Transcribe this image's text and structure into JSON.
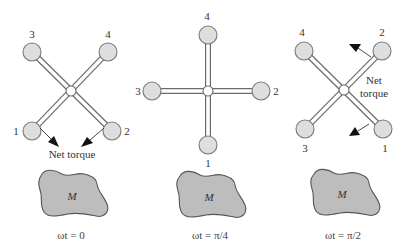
{
  "figure": {
    "panels": [
      {
        "id": "panel-1",
        "caption": "ωt = 0",
        "mass_label": "M",
        "torque_label_line1": "Net torque",
        "torque_label_line2": "",
        "hub": {
          "x": 71,
          "y": 91
        },
        "masses": [
          {
            "label": "1",
            "x": 32,
            "y": 131
          },
          {
            "label": "2",
            "x": 112,
            "y": 131
          },
          {
            "label": "3",
            "x": 32,
            "y": 52
          },
          {
            "label": "4",
            "x": 108,
            "y": 52
          }
        ]
      },
      {
        "id": "panel-2",
        "caption": "ωt = π/4",
        "mass_label": "M",
        "hub": {
          "x": 208,
          "y": 91
        },
        "masses": [
          {
            "label": "1",
            "x": 208,
            "y": 145
          },
          {
            "label": "2",
            "x": 261,
            "y": 91
          },
          {
            "label": "3",
            "x": 152,
            "y": 91
          },
          {
            "label": "4",
            "x": 208,
            "y": 35
          }
        ]
      },
      {
        "id": "panel-3",
        "caption": "ωt = π/2",
        "mass_label": "M",
        "torque_label_line1": "Net",
        "torque_label_line2": "torque",
        "hub": {
          "x": 344,
          "y": 89
        },
        "masses": [
          {
            "label": "1",
            "x": 383,
            "y": 129
          },
          {
            "label": "2",
            "x": 382,
            "y": 51
          },
          {
            "label": "3",
            "x": 305,
            "y": 129
          },
          {
            "label": "4",
            "x": 304,
            "y": 51
          }
        ]
      }
    ],
    "colors": {
      "mass_fill": "#dedede",
      "blob_fill": "#bdbdbd",
      "outline": "#6b6b6b",
      "arrow": "#111111"
    }
  }
}
